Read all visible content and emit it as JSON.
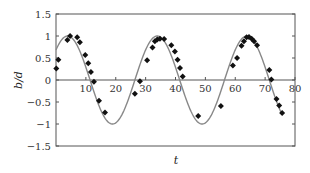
{
  "chart_data": {
    "type": "scatter",
    "title": "",
    "xlabel": "t",
    "ylabel": "b/d",
    "xlim": [
      0,
      80
    ],
    "ylim": [
      -1.5,
      1.5
    ],
    "xticks": [
      10,
      20,
      30,
      40,
      50,
      60,
      70,
      80
    ],
    "yticks": [
      1.5,
      1,
      0.5,
      0,
      -0.5,
      -1,
      -1.5
    ],
    "xtick_labels": [
      "10",
      "20",
      "30",
      "40",
      "50",
      "60",
      "70",
      "80"
    ],
    "ytick_labels": [
      "1.5",
      "1",
      "0.5",
      "0",
      "−0.5",
      "−1",
      "−1.5"
    ],
    "grid": false,
    "zero_line": true,
    "legend": null,
    "series": [
      {
        "name": "measured",
        "kind": "scatter",
        "marker": "diamond",
        "color": "#111111",
        "x": [
          0.1,
          0.8,
          3.8,
          4.7,
          7.1,
          8.0,
          9.8,
          10.8,
          11.7,
          12.7,
          14.4,
          16.4,
          26.4,
          28.1,
          30.5,
          32.3,
          33.1,
          33.9,
          34.8,
          36.2,
          38.6,
          39.8,
          40.7,
          41.5,
          42.4,
          47.6,
          55.2,
          59.2,
          60.6,
          62.1,
          62.9,
          63.8,
          64.6,
          65.5,
          66.3,
          67.3,
          71.4,
          72.1,
          73.8,
          74.7,
          75.7
        ],
        "y": [
          0.26,
          0.46,
          0.91,
          1.0,
          0.97,
          0.86,
          0.57,
          0.38,
          0.18,
          -0.04,
          -0.47,
          -0.74,
          -0.31,
          -0.03,
          0.45,
          0.74,
          0.88,
          0.92,
          0.94,
          0.93,
          0.79,
          0.65,
          0.46,
          0.27,
          0.08,
          -0.82,
          -0.59,
          0.33,
          0.5,
          0.78,
          0.88,
          0.97,
          0.98,
          0.94,
          0.88,
          0.79,
          0.23,
          0.01,
          -0.43,
          -0.58,
          -0.75
        ]
      },
      {
        "name": "model",
        "kind": "line",
        "color": "#888888",
        "formula": "cos(2*pi*(t-3.9)/30)",
        "amplitude": 1,
        "period": 30,
        "phase": 3.9,
        "t_range": [
          0,
          75.5
        ]
      }
    ]
  }
}
